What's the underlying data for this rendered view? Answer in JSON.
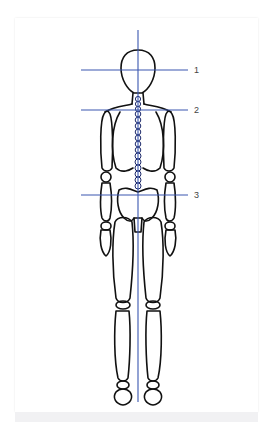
{
  "diagram": {
    "guide_color": "#3a56b0",
    "outline_color": "#111111",
    "guides": [
      {
        "label": "1",
        "y": 70
      },
      {
        "label": "2",
        "y": 110
      },
      {
        "label": "3",
        "y": 195
      }
    ]
  }
}
